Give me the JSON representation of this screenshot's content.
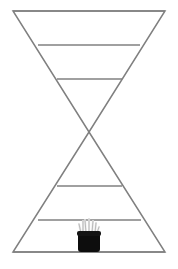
{
  "canvas": {
    "width": 178,
    "height": 269,
    "background_color": "#ffffff",
    "title": "Hourglass line figure with pot"
  },
  "style": {
    "line_color": "#808080",
    "line_color_dark": "#6e6e6e",
    "line_width": 1.5,
    "pot_fill": "#0d0d0d",
    "pot_rim": "#141414",
    "spike_fill": "#e8e8e8",
    "spike_stroke": "#9a9a9a",
    "spike_shadow": "#b4b4b4"
  },
  "geometry": {
    "top_left": {
      "x": 13,
      "y": 11
    },
    "top_right": {
      "x": 165,
      "y": 11
    },
    "center_apex": {
      "x": 89,
      "y": 132
    },
    "bottom_left": {
      "x": 13,
      "y": 252
    },
    "bottom_right": {
      "x": 165,
      "y": 252
    }
  },
  "shapes": {
    "upper_triangle": {
      "name": "inverted-triangle",
      "points": "13,11 165,11 89,132",
      "orientation": "point-down"
    },
    "lower_triangle": {
      "name": "upright-triangle",
      "points": "89,132 165,252 13,252",
      "orientation": "point-up"
    }
  },
  "rungs": [
    {
      "id": "rung-top-outer",
      "y": 11,
      "x1": 13,
      "x2": 165,
      "label": "top base line"
    },
    {
      "id": "rung-upper-1",
      "y": 45,
      "x1": 38,
      "x2": 140,
      "label": "upper rung 1"
    },
    {
      "id": "rung-upper-2",
      "y": 79,
      "x1": 57,
      "x2": 122,
      "label": "upper rung 2"
    },
    {
      "id": "rung-lower-1",
      "y": 186,
      "x1": 57,
      "x2": 122,
      "label": "lower rung 1"
    },
    {
      "id": "rung-lower-2",
      "y": 220,
      "x1": 38,
      "x2": 141,
      "label": "lower rung 2"
    },
    {
      "id": "rung-bottom-outer",
      "y": 252,
      "x1": 13,
      "x2": 165,
      "label": "bottom base line"
    }
  ],
  "pot": {
    "name": "plant-pot",
    "body": {
      "x": 78,
      "y": 233,
      "width": 22,
      "height": 19
    },
    "rim": {
      "x": 77,
      "y": 231,
      "width": 24,
      "height": 5
    },
    "contents_label": "spiky white foliage",
    "spikes": [
      {
        "x1": 81,
        "y1": 233,
        "x2": 79,
        "y2": 224
      },
      {
        "x1": 83,
        "y1": 233,
        "x2": 83,
        "y2": 221
      },
      {
        "x1": 86,
        "y1": 233,
        "x2": 85,
        "y2": 220
      },
      {
        "x1": 89,
        "y1": 233,
        "x2": 89,
        "y2": 219
      },
      {
        "x1": 92,
        "y1": 233,
        "x2": 93,
        "y2": 221
      },
      {
        "x1": 95,
        "y1": 233,
        "x2": 96,
        "y2": 223
      },
      {
        "x1": 97,
        "y1": 233,
        "x2": 99,
        "y2": 227
      }
    ]
  }
}
